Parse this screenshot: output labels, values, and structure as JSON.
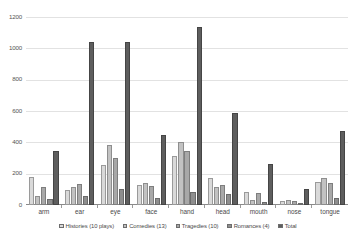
{
  "chart_data": {
    "type": "bar",
    "title": "",
    "subtitle": "",
    "xlabel": "",
    "ylabel": "",
    "ylim": [
      0,
      1200
    ],
    "ytick_labels": [
      "0",
      "200",
      "400",
      "600",
      "800",
      "1000",
      "1200"
    ],
    "ytick_values": [
      0,
      200,
      400,
      600,
      800,
      1000,
      1200
    ],
    "grid": true,
    "legend_position": "bottom",
    "categories": [
      "arm",
      "ear",
      "eye",
      "face",
      "hand",
      "head",
      "mouth",
      "nose",
      "tongue"
    ],
    "series": [
      {
        "name": "Histories (10 plays)",
        "color": "#d9d9d9",
        "values": [
          180,
          95,
          255,
          130,
          310,
          175,
          85,
          25,
          150
        ]
      },
      {
        "name": "Comedies (13)",
        "color": "#c2c2c2",
        "values": [
          55,
          115,
          380,
          140,
          400,
          115,
          35,
          30,
          170
        ]
      },
      {
        "name": "Tragedies (10)",
        "color": "#a8a8a8",
        "values": [
          115,
          135,
          300,
          120,
          345,
          130,
          75,
          25,
          140
        ]
      },
      {
        "name": "Romances (4)",
        "color": "#8e8e8e",
        "values": [
          40,
          55,
          100,
          45,
          80,
          70,
          20,
          10,
          45
        ]
      },
      {
        "name": "Total",
        "color": "#5e5e5e",
        "values": [
          345,
          1040,
          1040,
          450,
          1135,
          590,
          260,
          105,
          475
        ]
      }
    ]
  },
  "legend": {
    "items": [
      {
        "label": "Histories (10 plays)"
      },
      {
        "label": "Comedies (13)"
      },
      {
        "label": "Tragedies (10)"
      },
      {
        "label": "Romances (4)"
      },
      {
        "label": "Total"
      }
    ]
  }
}
